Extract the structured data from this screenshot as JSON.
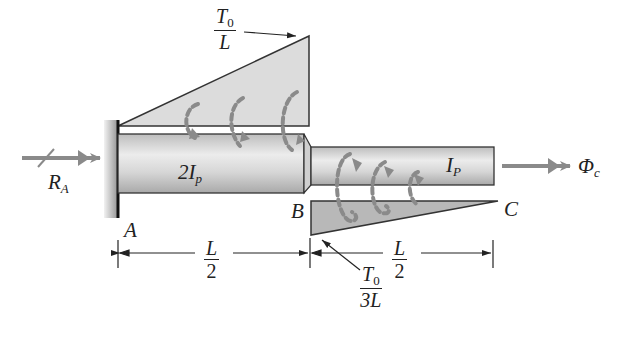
{
  "diagram": {
    "type": "stepped shaft with distributed torque",
    "labels": {
      "reaction": "R",
      "reaction_sub": "A",
      "point_a": "A",
      "point_b": "B",
      "point_c": "C",
      "shaft1_label": "2I",
      "shaft1_sub": "p",
      "shaft2_label": "I",
      "shaft2_sub": "P",
      "angle_label": "Φ",
      "angle_sub": "c"
    },
    "top_load": {
      "numerator": "T",
      "numerator_sub": "0",
      "denominator": "L"
    },
    "bottom_load": {
      "numerator": "T",
      "numerator_sub": "0",
      "denominator": "3L"
    },
    "dimensions": [
      {
        "numerator": "L",
        "denominator": "2"
      },
      {
        "numerator": "L",
        "denominator": "2"
      }
    ],
    "colors": {
      "line": "#333333",
      "load_fill": "#d8d8d8",
      "bottom_load_fill": "#b4b4b4",
      "arrow": "#8a8a8a",
      "shaft_light": "#e6e6e6",
      "shaft_dark": "#a8a8a8"
    }
  }
}
